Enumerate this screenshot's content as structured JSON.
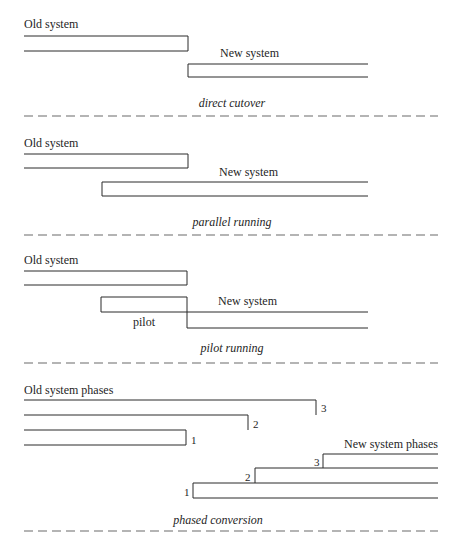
{
  "sections": [
    {
      "id": "direct-cutover",
      "old_label": "Old system",
      "new_label": "New system",
      "caption": "direct cutover"
    },
    {
      "id": "parallel-running",
      "old_label": "Old system",
      "new_label": "New system",
      "caption": "parallel running"
    },
    {
      "id": "pilot-running",
      "old_label": "Old system",
      "new_label": "New system",
      "pilot_label": "pilot",
      "caption": "pilot running"
    },
    {
      "id": "phased-conversion",
      "old_label": "Old system phases",
      "new_label": "New system phases",
      "old_phase_numbers": [
        "3",
        "2",
        "1"
      ],
      "new_phase_numbers": [
        "3",
        "2",
        "1"
      ],
      "caption": "phased conversion"
    }
  ],
  "colors": {
    "line": "#2a2a2a",
    "dash": "#6a6a6a",
    "text": "#1e1e1e",
    "background": "#ffffff"
  }
}
